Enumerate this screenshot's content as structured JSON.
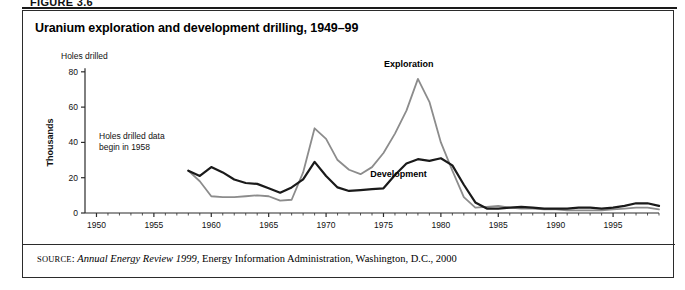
{
  "figure_header": "FIGURE 3.6",
  "title": "Uranium exploration and development drilling, 1949–99",
  "axis": {
    "y_header": "Holes drilled",
    "y_unit_label": "Thousands",
    "y_ticks": [
      "0",
      "20",
      "40",
      "60",
      "80"
    ],
    "x_ticks": [
      "1950",
      "1955",
      "1960",
      "1965",
      "1970",
      "1975",
      "1980",
      "1985",
      "1990",
      "1995"
    ]
  },
  "annotation": {
    "line1": "Holes drilled data",
    "line2": "begin in 1958"
  },
  "series_labels": {
    "exploration": "Exploration",
    "development": "Development"
  },
  "source": {
    "prefix": "SOURCE",
    "colon": ": ",
    "italic_part": "Annual Energy Review 1999",
    "rest": ", Energy Information Administration, Washington, D.C., 2000"
  },
  "colors": {
    "exploration_line": "#8c8c8c",
    "development_line": "#1a1a1a",
    "axis": "#2b2b2b",
    "frame": "#2b2b2b",
    "background": "#ffffff"
  },
  "chart_data": {
    "type": "line",
    "title": "Uranium exploration and development drilling, 1949–99",
    "xlabel": "",
    "ylabel": "Holes drilled (Thousands)",
    "xlim": [
      1949,
      1999
    ],
    "ylim": [
      0,
      85
    ],
    "y_ticks": [
      0,
      20,
      40,
      60,
      80
    ],
    "x_ticks": [
      1950,
      1955,
      1960,
      1965,
      1970,
      1975,
      1980,
      1985,
      1990,
      1995
    ],
    "grid": false,
    "legend": "inline-labels",
    "note": "Holes drilled data begin in 1958",
    "x": [
      1958,
      1959,
      1960,
      1961,
      1962,
      1963,
      1964,
      1965,
      1966,
      1967,
      1968,
      1969,
      1970,
      1971,
      1972,
      1973,
      1974,
      1975,
      1976,
      1977,
      1978,
      1979,
      1980,
      1981,
      1982,
      1983,
      1984,
      1985,
      1986,
      1987,
      1988,
      1989,
      1990,
      1991,
      1992,
      1993,
      1994,
      1995,
      1996,
      1997,
      1998,
      1999
    ],
    "series": [
      {
        "name": "Exploration",
        "color": "#8c8c8c",
        "values": [
          24.0,
          18.0,
          9.5,
          9.0,
          9.0,
          9.5,
          10.0,
          9.5,
          7.0,
          7.5,
          23.0,
          48.0,
          42.0,
          30.0,
          24.5,
          22.0,
          26.0,
          34.0,
          45.0,
          58.0,
          76.0,
          63.0,
          40.0,
          24.0,
          9.0,
          3.0,
          3.5,
          4.0,
          3.0,
          2.5,
          2.5,
          2.0,
          2.0,
          1.5,
          1.5,
          1.5,
          1.5,
          2.0,
          2.5,
          3.0,
          3.0,
          2.0
        ]
      },
      {
        "name": "Development",
        "color": "#1a1a1a",
        "values": [
          24.0,
          21.0,
          26.0,
          23.0,
          19.0,
          17.0,
          16.5,
          14.0,
          11.5,
          14.5,
          19.0,
          29.0,
          21.0,
          14.5,
          12.5,
          13.0,
          13.5,
          14.0,
          21.5,
          28.0,
          30.5,
          29.5,
          31.0,
          27.0,
          16.0,
          6.0,
          2.5,
          2.5,
          3.0,
          3.5,
          3.0,
          2.5,
          2.5,
          2.5,
          3.0,
          3.0,
          2.5,
          3.0,
          4.0,
          5.5,
          5.5,
          4.0
        ]
      }
    ]
  }
}
